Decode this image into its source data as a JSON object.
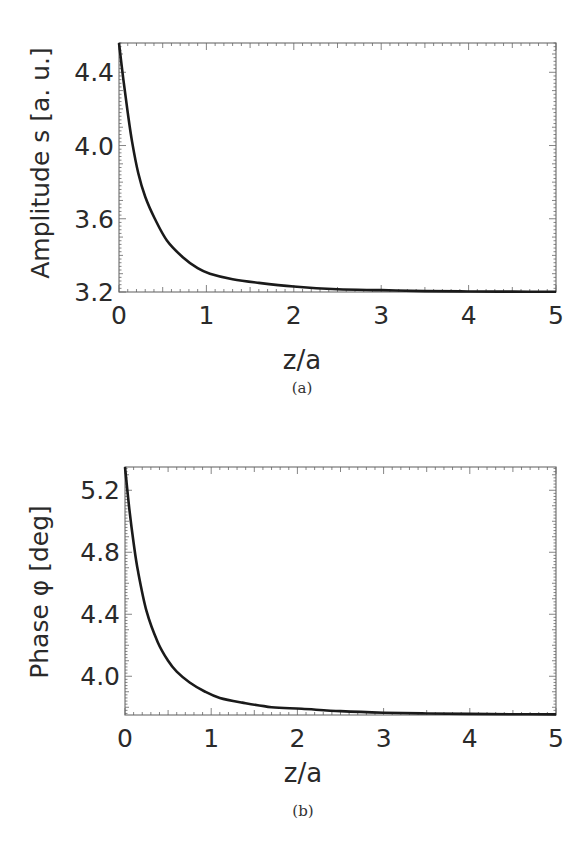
{
  "figure": {
    "panels": [
      {
        "id": "a",
        "caption": "(a)"
      },
      {
        "id": "b",
        "caption": "(b)"
      }
    ]
  },
  "chart_data": [
    {
      "type": "line",
      "title": "",
      "caption": "(a)",
      "xlabel": "z/a",
      "ylabel": "Amplitude s [a. u.]",
      "xlim": [
        0,
        5
      ],
      "ylim": [
        3.2,
        4.56
      ],
      "xticks": [
        0,
        1,
        2,
        3,
        4,
        5
      ],
      "xtick_labels": [
        "0",
        "1",
        "2",
        "3",
        "4",
        "5"
      ],
      "yticks": [
        3.2,
        3.6,
        4.0,
        4.4
      ],
      "ytick_labels": [
        "3.2",
        "3.6",
        "4.0",
        "4.4"
      ],
      "grid": false,
      "legend": null,
      "line_color": "#1a1a1a",
      "series": [
        {
          "name": "Amplitude s",
          "x": [
            0,
            0.05,
            0.1,
            0.15,
            0.22,
            0.3,
            0.41,
            0.55,
            0.73,
            0.9,
            1.04,
            1.3,
            1.6,
            2.0,
            2.5,
            3.0,
            3.5,
            4.0,
            4.5,
            5.0
          ],
          "y": [
            4.56,
            4.36,
            4.18,
            4.02,
            3.85,
            3.72,
            3.6,
            3.48,
            3.39,
            3.33,
            3.3,
            3.27,
            3.25,
            3.23,
            3.215,
            3.21,
            3.205,
            3.203,
            3.202,
            3.201
          ]
        }
      ]
    },
    {
      "type": "line",
      "title": "",
      "caption": "(b)",
      "xlabel": "z/a",
      "ylabel": "Phase φ [deg]",
      "xlim": [
        0,
        5
      ],
      "ylim": [
        3.75,
        5.35
      ],
      "xticks": [
        0,
        1,
        2,
        3,
        4,
        5
      ],
      "xtick_labels": [
        "0",
        "1",
        "2",
        "3",
        "4",
        "5"
      ],
      "yticks": [
        4.0,
        4.4,
        4.8,
        5.2
      ],
      "ytick_labels": [
        "4.0",
        "4.4",
        "4.8",
        "5.2"
      ],
      "grid": false,
      "legend": null,
      "line_color": "#1a1a1a",
      "series": [
        {
          "name": "Phase φ",
          "x": [
            0,
            0.05,
            0.1,
            0.15,
            0.25,
            0.38,
            0.5,
            0.6,
            0.75,
            0.93,
            1.1,
            1.36,
            1.7,
            2.05,
            2.5,
            3.0,
            3.5,
            4.0,
            4.5,
            5.0
          ],
          "y": [
            5.35,
            5.08,
            4.86,
            4.68,
            4.42,
            4.22,
            4.1,
            4.03,
            3.96,
            3.9,
            3.86,
            3.83,
            3.8,
            3.79,
            3.775,
            3.765,
            3.76,
            3.757,
            3.755,
            3.754
          ]
        }
      ]
    }
  ]
}
